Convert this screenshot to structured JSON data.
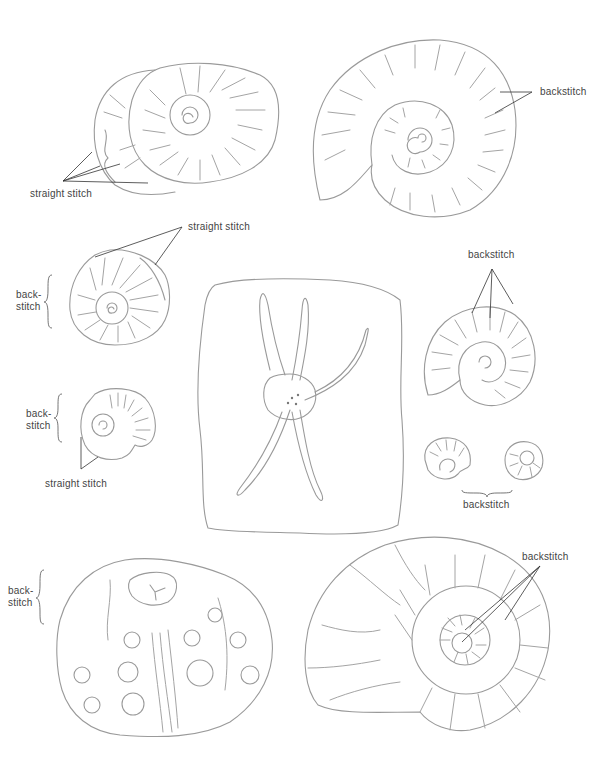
{
  "page": {
    "background": "#ffffff",
    "line_color": "#9a9a9a",
    "label_color": "#444444"
  },
  "figures": [
    {
      "id": "snail-shell-top-left",
      "label": "straight stitch"
    },
    {
      "id": "ammonite-top-right",
      "label": "backstitch"
    },
    {
      "id": "small-ammonite-mid-left",
      "label_top": "straight stitch",
      "label_side": "back-\nstitch"
    },
    {
      "id": "tiny-ammonite-left",
      "label_side": "back-\nstitch",
      "label_bottom": "straight stitch"
    },
    {
      "id": "starfish-slab-center"
    },
    {
      "id": "ammonite-mid-right",
      "label": "backstitch"
    },
    {
      "id": "tiny-shells-pair-right",
      "label": "backstitch"
    },
    {
      "id": "sea-urchin-bottom-left",
      "label_side": "back-\nstitch"
    },
    {
      "id": "nautilus-bottom-right",
      "label": "backstitch"
    }
  ]
}
